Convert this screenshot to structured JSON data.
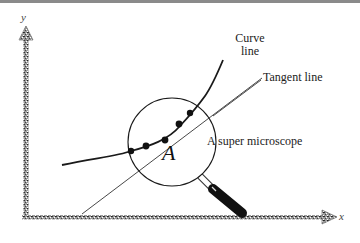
{
  "diagram": {
    "axes": {
      "x_label": "x",
      "y_label": "y"
    },
    "labels": {
      "curve_line_1": "Curve",
      "curve_line_2": "line",
      "tangent_line": "Tangent line",
      "microscope": "A super microscope",
      "point": "A"
    },
    "elements": [
      "curve",
      "tangent-line",
      "magnifier-lens",
      "magnifier-handle",
      "dots"
    ],
    "colors": {
      "ink": "#1a1a1a",
      "axis": "#555555",
      "background": "#ffffff",
      "topbar": "#8a8a8a"
    }
  }
}
